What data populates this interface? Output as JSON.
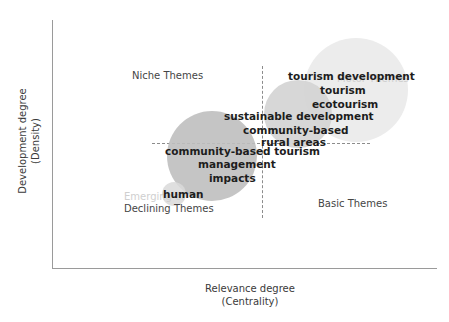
{
  "chart_data": {
    "type": "scatter",
    "title": "",
    "xlabel": "Relevance degree\n(Centrality)",
    "ylabel": "Development degree\n(Density)",
    "axis": {
      "x_title_line1": "Relevance degree",
      "x_title_line2": "(Centrality)",
      "y_title_line1": "Development degree",
      "y_title_line2": "(Density)",
      "x_ticks": [],
      "y_ticks": [],
      "grid": false,
      "legend": "none"
    },
    "quadrants": [
      {
        "id": "niche",
        "label": "Niche Themes",
        "position": "top-left",
        "color": "#454545"
      },
      {
        "id": "motor",
        "label": "Motor Themes",
        "position": "top-right",
        "color": "#cfcfcf"
      },
      {
        "id": "emerging",
        "label": "Emerging or",
        "position": "bottom-left",
        "color": "#cfcfcf"
      },
      {
        "id": "declining",
        "label": "Declining Themes",
        "position": "bottom-left",
        "color": "#454545"
      },
      {
        "id": "basic",
        "label": "Basic Themes",
        "position": "bottom-right",
        "color": "#454545"
      }
    ],
    "bubbles": [
      {
        "name": "motor-cluster",
        "label": "tourism development cluster",
        "cx": 356,
        "cy": 90,
        "r": 52,
        "color": "#ececec"
      },
      {
        "name": "middle-cluster",
        "label": "sustainable development cluster",
        "cx": 298,
        "cy": 114,
        "r": 34,
        "color": "#d4d4d4"
      },
      {
        "name": "declining-cluster",
        "label": "community-based tourism cluster",
        "cx": 212,
        "cy": 156,
        "r": 45,
        "color": "#bfbfbf"
      },
      {
        "name": "human-cluster",
        "label": "human cluster",
        "cx": 174,
        "cy": 194,
        "r": 12,
        "color": "#d9d9d9"
      }
    ],
    "terms": [
      {
        "id": "tourism-development",
        "label": "tourism development",
        "quadrant": "motor"
      },
      {
        "id": "tourism",
        "label": "tourism",
        "quadrant": "motor"
      },
      {
        "id": "ecotourism",
        "label": "ecotourism",
        "quadrant": "motor"
      },
      {
        "id": "sustainable-development",
        "label": "sustainable development",
        "quadrant": "motor"
      },
      {
        "id": "community-based",
        "label": "community-based",
        "quadrant": "motor"
      },
      {
        "id": "rural-areas",
        "label": "rural areas",
        "quadrant": "motor"
      },
      {
        "id": "community-based-tourism",
        "label": "community-based tourism",
        "quadrant": "declining"
      },
      {
        "id": "management",
        "label": "management",
        "quadrant": "declining"
      },
      {
        "id": "impacts",
        "label": "impacts",
        "quadrant": "declining"
      },
      {
        "id": "human",
        "label": "human",
        "quadrant": "declining"
      }
    ]
  }
}
